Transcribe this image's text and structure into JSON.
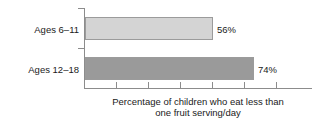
{
  "chart_data": {
    "type": "bar",
    "orientation": "horizontal",
    "title": "",
    "subtitle": "",
    "xlabel": "Percentage of children who eat less than one fruit serving/day",
    "xlabel_lines": [
      "Percentage of children who eat less than",
      "one fruit serving/day"
    ],
    "ylabel": "",
    "categories": [
      "Ages 6–11",
      "Ages 12–18"
    ],
    "values": [
      56,
      74
    ],
    "value_labels": [
      "56%",
      "74%"
    ],
    "value_suffix": "%",
    "xlim": [
      0,
      100
    ],
    "ylim": null,
    "xticks": [
      0,
      14,
      28,
      42,
      57,
      71,
      85,
      100
    ],
    "xticklabels": [
      "",
      "",
      "",
      "",
      "",
      "",
      "",
      ""
    ],
    "grid": false,
    "legend": false,
    "legend_position": "none",
    "bar_colors": [
      "#d4d4d4",
      "#9a9a9a"
    ],
    "bar_edge_color": "#9b9b9b",
    "axis_color": "#8c8c8c",
    "text_color": "#1a1a1a",
    "background": "#ffffff"
  },
  "chart": {
    "axis": {
      "y_axis_name": "category-axis",
      "x_axis_name": "value-axis"
    },
    "rows": [
      {
        "label": "Ages 6–11",
        "value_label": "56%",
        "value": 56
      },
      {
        "label": "Ages 12–18",
        "value_label": "74%",
        "value": 74
      }
    ],
    "caption_line_1": "Percentage of children who eat less than",
    "caption_line_2": "one fruit serving/day"
  }
}
